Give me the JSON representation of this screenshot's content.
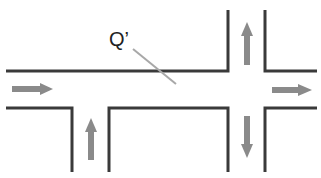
{
  "diagram": {
    "type": "road-intersection",
    "label": "Q’",
    "colors": {
      "wall": "#3a3a3a",
      "arrow": "#8a8a8a",
      "pointer": "#a8a8a8",
      "background": "#ffffff"
    },
    "arrows": [
      {
        "name": "left-road-arrow",
        "direction": "right"
      },
      {
        "name": "right-road-arrow",
        "direction": "right"
      },
      {
        "name": "top-road-arrow",
        "direction": "up"
      },
      {
        "name": "bottom-right-road-arrow",
        "direction": "down"
      },
      {
        "name": "bottom-left-road-arrow",
        "direction": "up"
      }
    ]
  }
}
